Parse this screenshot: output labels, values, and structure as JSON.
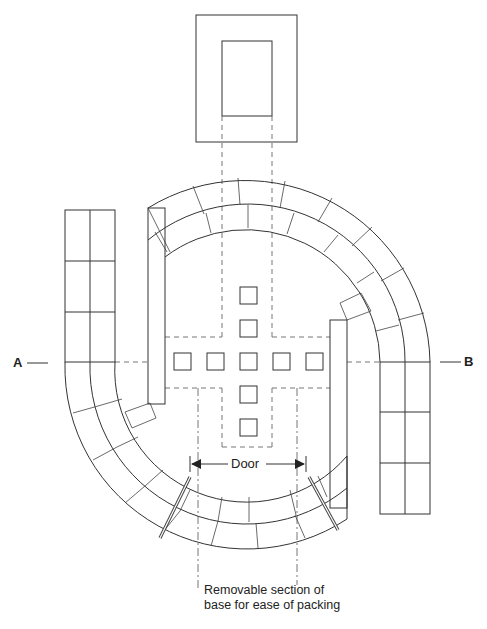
{
  "diagram": {
    "type": "plan-view",
    "labels": {
      "section_left": "A",
      "section_right": "B",
      "door": "Door",
      "note_line1": "Removable section of",
      "note_line2": "base for ease of packing"
    },
    "elements": [
      "top-box-outer",
      "top-box-inner",
      "left-straight-column",
      "right-straight-column",
      "curved-wall-upper",
      "curved-wall-lower",
      "left-inner-wall",
      "right-inner-wall",
      "grid-of-squares",
      "dashed-cross-projection",
      "removable-section-markers"
    ],
    "grid_squares": {
      "rows": 5,
      "cols": 5,
      "pattern": "cross"
    },
    "colors": {
      "line": "#333333",
      "dashed": "#777777",
      "background": "#ffffff"
    }
  }
}
